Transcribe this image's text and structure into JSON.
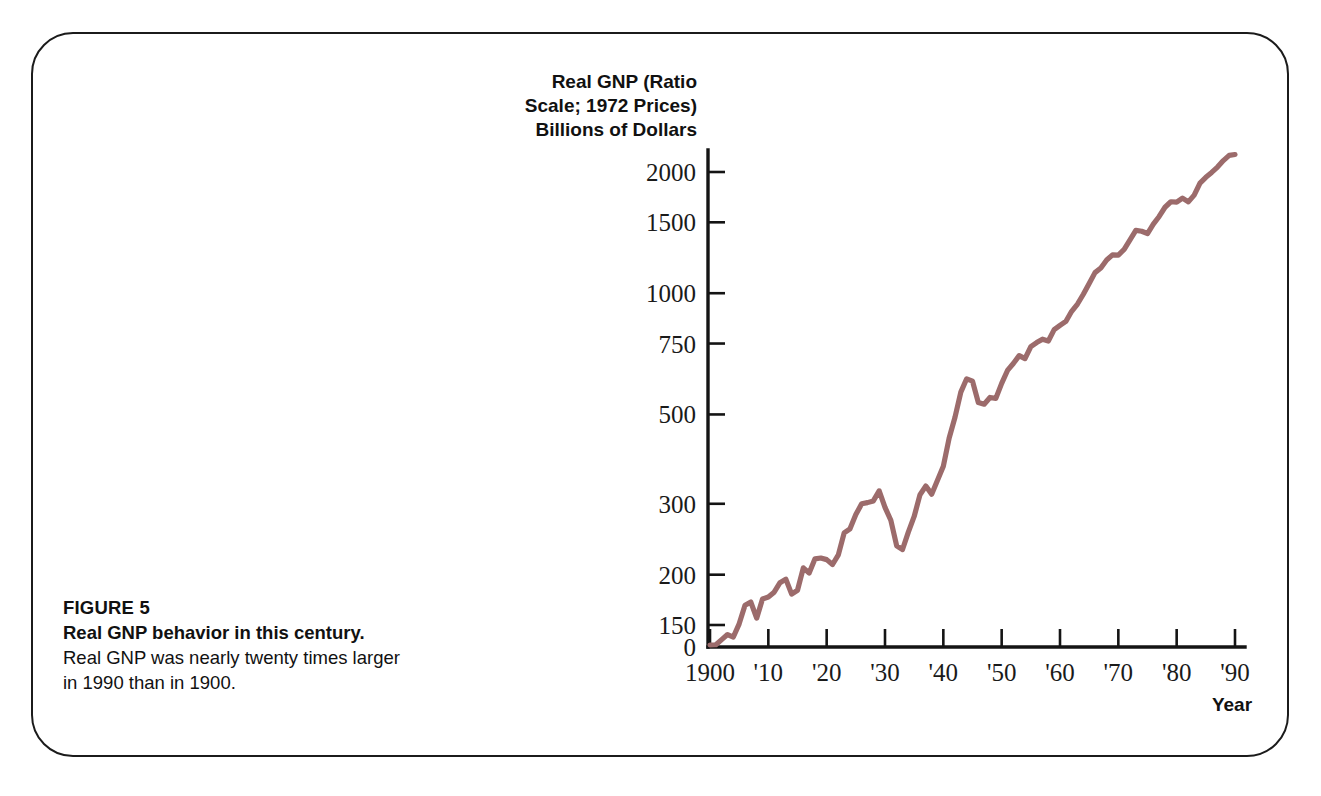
{
  "figure": {
    "number_label": "FIGURE 5",
    "title": "Real GNP behavior in this century.",
    "description_line_1": "Real GNP was nearly twenty times larger",
    "description_line_2": "in 1990 than in 1900."
  },
  "colors": {
    "series_line": "#9c6b6b",
    "axis": "#141414",
    "text": "#111111",
    "background": "#ffffff"
  },
  "chart_data": {
    "type": "line",
    "title": "",
    "axis_title_lines": [
      "Real GNP (Ratio",
      "Scale; 1972 Prices)",
      "Billions of Dollars"
    ],
    "xlabel": "Year",
    "ylabel": "Real GNP (Ratio Scale; 1972 Prices) Billions of Dollars",
    "yscale": "log",
    "ylim": [
      130,
      2100
    ],
    "origin_label": "0",
    "axis_break": true,
    "grid": false,
    "legend": "none",
    "ytick_values": [
      150,
      200,
      300,
      500,
      750,
      1000,
      1500,
      2000
    ],
    "ytick_labels": [
      "150",
      "200",
      "300",
      "500",
      "750",
      "1000",
      "1500",
      "2000"
    ],
    "xtick_values": [
      1900,
      1910,
      1920,
      1930,
      1940,
      1950,
      1960,
      1970,
      1980,
      1990
    ],
    "xtick_labels": [
      "1900",
      "'10",
      "'20",
      "'30",
      "'40",
      "'50",
      "'60",
      "'70",
      "'80",
      "'90"
    ],
    "xlim": [
      1900,
      1990
    ],
    "series": [
      {
        "name": "Real GNP",
        "color": "#9c6b6b",
        "x": [
          1900,
          1901,
          1902,
          1903,
          1904,
          1905,
          1906,
          1907,
          1908,
          1909,
          1910,
          1911,
          1912,
          1913,
          1914,
          1915,
          1916,
          1917,
          1918,
          1919,
          1920,
          1921,
          1922,
          1923,
          1924,
          1925,
          1926,
          1927,
          1928,
          1929,
          1930,
          1931,
          1932,
          1933,
          1934,
          1935,
          1936,
          1937,
          1938,
          1939,
          1940,
          1941,
          1942,
          1943,
          1944,
          1945,
          1946,
          1947,
          1948,
          1949,
          1950,
          1951,
          1952,
          1953,
          1954,
          1955,
          1956,
          1957,
          1958,
          1959,
          1960,
          1961,
          1962,
          1963,
          1964,
          1965,
          1966,
          1967,
          1968,
          1969,
          1970,
          1971,
          1972,
          1973,
          1974,
          1975,
          1976,
          1977,
          1978,
          1979,
          1980,
          1981,
          1982,
          1983,
          1984,
          1985,
          1986,
          1987,
          1988,
          1989,
          1990
        ],
        "values": [
          133,
          134,
          138,
          142,
          140,
          151,
          168,
          171,
          156,
          174,
          176,
          181,
          191,
          195,
          179,
          183,
          208,
          202,
          219,
          220,
          218,
          212,
          224,
          254,
          260,
          282,
          300,
          302,
          305,
          323,
          294,
          273,
          236,
          231,
          255,
          279,
          316,
          332,
          317,
          343,
          372,
          437,
          492,
          568,
          613,
          605,
          535,
          530,
          551,
          548,
          597,
          643,
          669,
          700,
          688,
          737,
          754,
          769,
          761,
          812,
          832,
          851,
          902,
          940,
          994,
          1057,
          1125,
          1155,
          1209,
          1245,
          1244,
          1285,
          1356,
          1432,
          1425,
          1407,
          1484,
          1551,
          1635,
          1687,
          1683,
          1723,
          1686,
          1752,
          1876,
          1940,
          1995,
          2057,
          2135,
          2200,
          2210
        ]
      }
    ],
    "annotations": []
  }
}
